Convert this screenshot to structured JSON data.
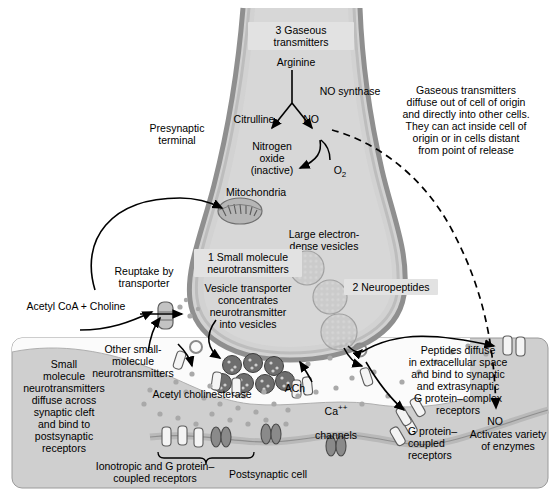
{
  "figure": {
    "type": "biological-diagram"
  },
  "palette": {
    "cytoplasm": "#d2d2d2",
    "cytoplasm_light": "#dcdcdc",
    "membrane": "#a8a8a8",
    "membrane_dark": "#8f8f8f",
    "postsynaptic": "#cfcfcf",
    "cleft": "#fbfbfb",
    "vesicle_small": "#6e6e6e",
    "vesicle_large": "#b4b4b4",
    "receptor_white": "#f4f4f4",
    "receptor_dark": "#8a8a8a",
    "stroke": "#000000",
    "label_box": "#e2e2e2"
  },
  "callouts": {
    "gaseous": "3 Gaseous\ntransmitters",
    "small_molecule": "1 Small molecule\nneurotransmitters",
    "neuropeptides": "2 Neuropeptides"
  },
  "labels": {
    "presynaptic_terminal": "Presynaptic\nterminal",
    "arginine": "Arginine",
    "no_synthase": "NO synthase",
    "citrulline": "Citrulline",
    "no": "NO",
    "nitrogen_oxide": "Nitrogen\noxide\n(inactive)",
    "o2_text": "O",
    "o2_sub": "2",
    "mitochondria": "Mitochondria",
    "large_dense_vesicles": "Large electron-\ndense vesicles",
    "vesicle_transporter": "Vesicle transporter\nconcentrates\nneurotransmitter\ninto vesicles",
    "reuptake": "Reuptake by\ntransporter",
    "acetyl_coa_choline": "Acetyl CoA + Choline",
    "other_small_molecule": "Other small-\nmolecule\nneurotransmitters",
    "small_molecule_diffuse": "Small\nmolecule\nneurotransmitters\ndiffuse across\nsynaptic cleft\nand bind to\npostsynaptic\nreceptors",
    "acetyl_cholinesterase": "Acetyl cholinesterase",
    "ach": "ACh",
    "ca_text": "Ca",
    "ca_sup": "++",
    "ca_channels": "channels",
    "ionotropic_receptors": "Ionotropic and G protein–\ncoupled receptors",
    "postsynaptic_cell": "Postsynaptic cell",
    "g_protein_coupled": "G protein–\ncoupled\nreceptors",
    "peptides_diffuse": "Peptides diffuse\nin extracellular space\nand bind to synaptic\nand extrasynaptic\nG protein–complex\nreceptors",
    "gaseous_note": "Gaseous transmitters\ndiffuse out of cell of origin\nand directly into other cells.\nThey can act inside cell of\norigin or in cells distant\nfrom point of release",
    "no_right": "NO",
    "activates_enzymes": "Activates variety\nof enzymes"
  }
}
